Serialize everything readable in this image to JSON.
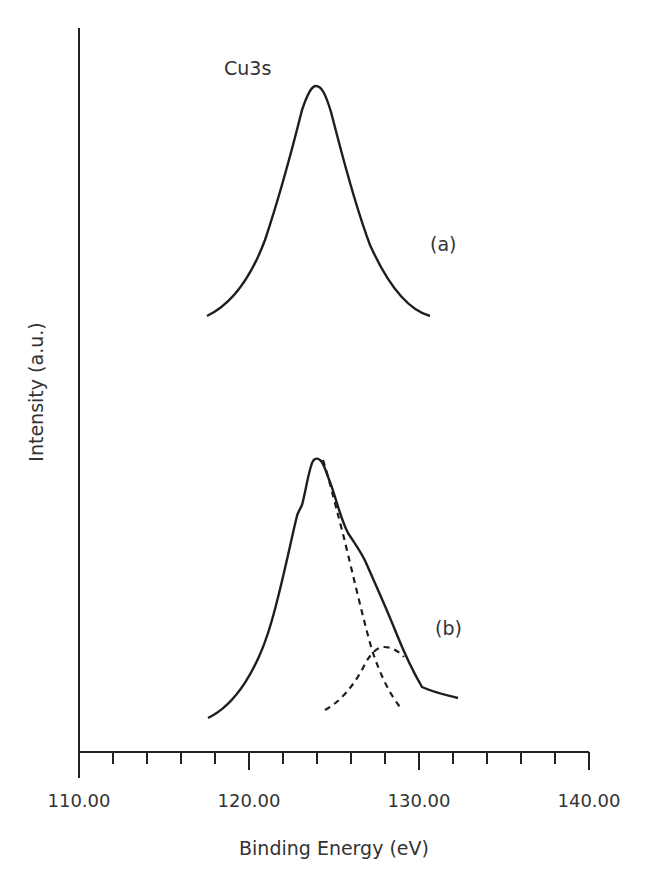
{
  "chart_data": {
    "type": "line",
    "title": "Cu3s",
    "xlabel": "Binding Energy (eV)",
    "ylabel": "Intensity (a.u.)",
    "xlim": [
      110,
      140
    ],
    "x_ticks_major": [
      110,
      120,
      130,
      140
    ],
    "x_tick_labels": [
      "110.00",
      "120.00",
      "130.00",
      "140.00"
    ],
    "x_minor_tick_step": 2,
    "grid": false,
    "legend": null,
    "annotations": [
      "Cu3s",
      "(a)",
      "(b)"
    ],
    "series": [
      {
        "name": "(a)",
        "style": "solid",
        "peak_x": 124.0,
        "x_range": [
          117.5,
          130.6
        ],
        "description": "single symmetric Cu3s peak"
      },
      {
        "name": "(b)",
        "style": "solid",
        "peak_x": 124.0,
        "x_range": [
          117.6,
          132.3
        ],
        "description": "asymmetric Cu3s peak with high-BE shoulder near 128 eV"
      },
      {
        "name": "(b) fit component 1",
        "style": "dashed",
        "peak_x": 124.0,
        "x_range": [
          124.4,
          128.9
        ]
      },
      {
        "name": "(b) fit component 2",
        "style": "dashed",
        "peak_x": 127.9,
        "x_range": [
          124.5,
          129.1
        ]
      }
    ]
  },
  "labels": {
    "title": "Cu3s",
    "a": "(a)",
    "b": "(b)",
    "xlabel": "Binding Energy (eV)",
    "ylabel": "Intensity (a.u.)",
    "ticks": [
      "110.00",
      "120.00",
      "130.00",
      "140.00"
    ]
  }
}
